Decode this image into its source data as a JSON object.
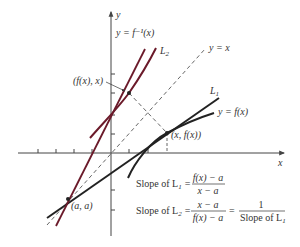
{
  "axes": {
    "x_label": "x",
    "y_label": "y"
  },
  "curves": {
    "f": {
      "label": "y = f(x)",
      "color": "#222222"
    },
    "f_inverse": {
      "label": "y = f⁻¹(x)",
      "color": "#6b1a2a"
    },
    "identity": {
      "label": "y = x",
      "style": "dashed"
    }
  },
  "lines": {
    "L1": {
      "label": "L",
      "subscript": "1",
      "color": "#222222"
    },
    "L2": {
      "label": "L",
      "subscript": "2",
      "color": "#6b1a2a"
    }
  },
  "points": {
    "aa": "(a, a)",
    "xfx": "(x, f(x))",
    "fxx": "(f(x), x)"
  },
  "equations": {
    "slope_L1": {
      "prefix": "Slope of L",
      "sub": "1",
      "eq": "=",
      "numerator": "f(x) − a",
      "denominator": "x − a"
    },
    "slope_L2": {
      "prefix": "Slope of L",
      "sub": "2",
      "eq": "=",
      "numerator": "x − a",
      "denominator": "f(x) − a",
      "eq2": "=",
      "numerator2": "1",
      "denominator2_prefix": "Slope of L",
      "denominator2_sub": "1"
    }
  },
  "colors": {
    "black_line": "#222222",
    "red_line": "#6b1a2a",
    "axis": "#444444",
    "dashed": "#555555"
  }
}
